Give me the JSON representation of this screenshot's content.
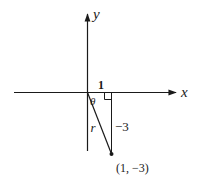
{
  "diagram": {
    "axes": {
      "x_label": "x",
      "y_label": "y"
    },
    "labels": {
      "horizontal_leg": "1",
      "vertical_leg": "−3",
      "hypotenuse": "r",
      "angle": "θ",
      "point": "(1, −3)"
    },
    "colors": {
      "stroke": "#1a1a1a",
      "background": "#ffffff"
    }
  }
}
